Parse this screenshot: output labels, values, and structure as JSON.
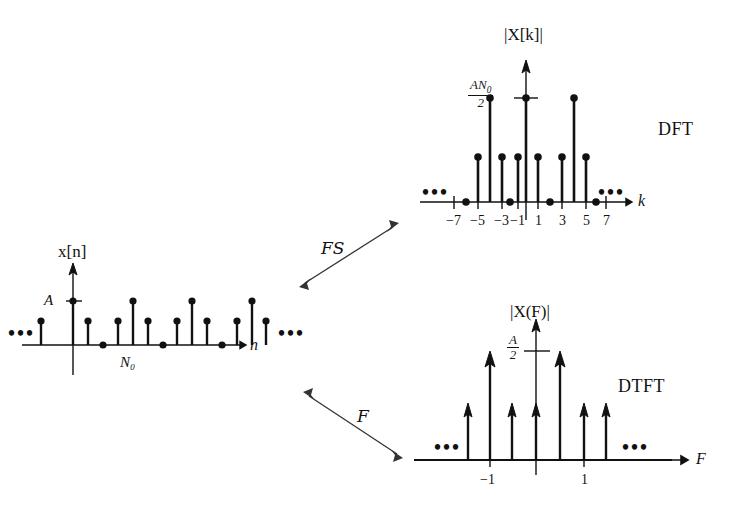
{
  "figure": {
    "width": 731,
    "height": 532,
    "background": "#ffffff",
    "ink": "#111111"
  },
  "panels": {
    "time": {
      "name": "time-domain-signal",
      "y_axis_label": "x[n]",
      "x_axis_label": "n",
      "amplitude_label": "A",
      "period_label": "N0",
      "period_label_display": "N₀",
      "left_ellipsis": "•••",
      "right_ellipsis": "•••"
    },
    "dft": {
      "name": "dft-magnitude-spectrum",
      "y_axis_label": "|X[k]|",
      "x_axis_label": "k",
      "peak_label_numerator": "AN0",
      "peak_label_denominator": "2",
      "method_label": "DFT",
      "left_ellipsis": "•••",
      "right_ellipsis": "•••",
      "tick_labels": [
        "−7",
        "−5",
        "−3",
        "−1",
        "1",
        "3",
        "5",
        "7"
      ]
    },
    "dtft": {
      "name": "dtft-magnitude-spectrum",
      "y_axis_label": "|X(F)|",
      "x_axis_label": "F",
      "peak_label_numerator": "A",
      "peak_label_denominator": "2",
      "method_label": "DTFT",
      "left_ellipsis": "•••",
      "right_ellipsis": "•••",
      "tick_labels": [
        "−1",
        "1"
      ]
    }
  },
  "transform_arrows": [
    {
      "name": "fourier-series-arrow",
      "label": "FS",
      "label_full": "Fourier Series"
    },
    {
      "name": "fourier-transform-arrow",
      "label": "F",
      "label_full": "Fourier Transform"
    }
  ],
  "chart_data": [
    {
      "id": "time-domain",
      "type": "stem",
      "title": "x[n]",
      "xlabel": "n",
      "ylabel": "x[n]",
      "ylim": [
        0,
        1.0
      ],
      "annotations": [
        "A",
        "N0"
      ],
      "x": [
        -5,
        -4,
        -3,
        -2,
        -1,
        0,
        1,
        2,
        3,
        4,
        5,
        6,
        7,
        8,
        9,
        10,
        11,
        12,
        13
      ],
      "values": [
        0.56,
        0,
        0.56,
        1.0,
        0.56,
        1.0,
        0.56,
        0,
        0.56,
        1.0,
        0.56,
        0.56,
        0,
        0.56,
        1.0,
        0.56,
        0.56,
        0,
        0.56
      ]
    },
    {
      "id": "dft-magnitude",
      "type": "stem",
      "title": "|X[k]|",
      "xlabel": "k",
      "ylabel": "|X[k]|",
      "ylim": [
        0,
        1.0
      ],
      "annotations": [
        "AN0/2"
      ],
      "categories": [
        "−7",
        "−6",
        "−5",
        "−4",
        "−3",
        "−2",
        "−1",
        "0",
        "1",
        "2",
        "3",
        "4",
        "5",
        "6",
        "7"
      ],
      "x": [
        -7,
        -6,
        -5,
        -4,
        -3,
        -2,
        -1,
        0,
        1,
        2,
        3,
        4,
        5,
        6,
        7
      ],
      "values": [
        0,
        0,
        0.47,
        1.0,
        0.47,
        0,
        0.47,
        1.0,
        0.47,
        0,
        0.47,
        1.0,
        0.47,
        0,
        0
      ],
      "xticks": [
        -7,
        -5,
        -3,
        -1,
        1,
        3,
        5,
        7
      ]
    },
    {
      "id": "dtft-magnitude",
      "type": "stem",
      "title": "|X(F)|",
      "xlabel": "F",
      "ylabel": "|X(F)|",
      "ylim": [
        0,
        1.0
      ],
      "annotations": [
        "A/2"
      ],
      "x": [
        -1.25,
        -1.0,
        -0.75,
        -0.5,
        0,
        0.25,
        0.5,
        1.0,
        1.25
      ],
      "values": [
        0.47,
        1.0,
        0.47,
        0.47,
        1.0,
        0.47,
        0.47,
        1.0,
        0.47
      ],
      "xticks": [
        -1,
        1
      ]
    }
  ]
}
